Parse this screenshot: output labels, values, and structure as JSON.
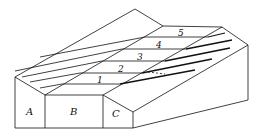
{
  "diagram": {
    "kind": "block-diagram",
    "faces": [
      {
        "id": "A",
        "label": "A"
      },
      {
        "id": "B",
        "label": "B"
      },
      {
        "id": "C",
        "label": "C"
      }
    ],
    "beds": [
      {
        "id": "1",
        "label": "1"
      },
      {
        "id": "2",
        "label": "2"
      },
      {
        "id": "3",
        "label": "3"
      },
      {
        "id": "4",
        "label": "4"
      },
      {
        "id": "5",
        "label": "5"
      }
    ],
    "colors": {
      "line": "#111111",
      "background": "#ffffff"
    }
  }
}
